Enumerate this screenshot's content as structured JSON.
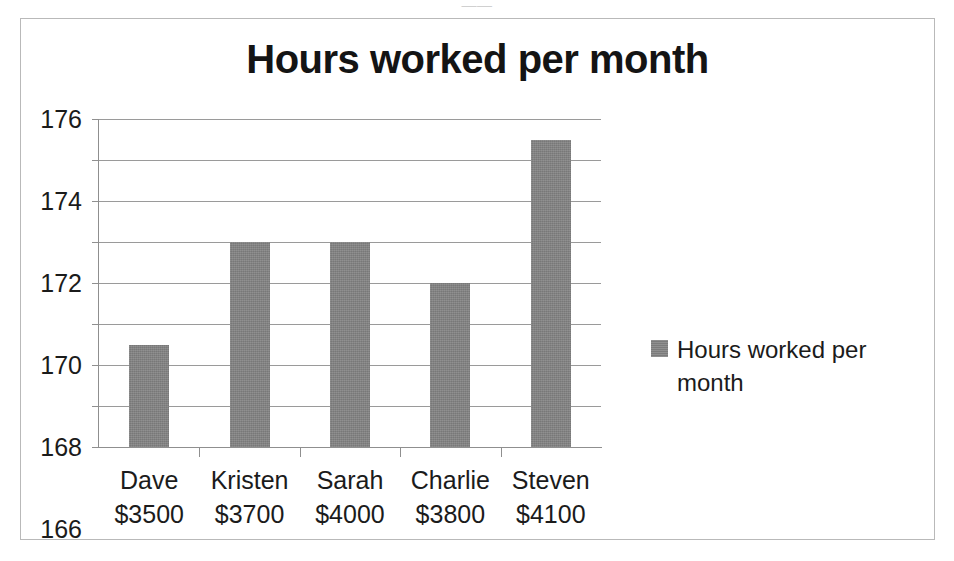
{
  "scan": {
    "top_remnant_text": "——"
  },
  "chart_data": {
    "type": "bar",
    "title": "Hours worked per month",
    "xlabel": "",
    "ylabel": "",
    "ylim": [
      160,
      176
    ],
    "ystep": 2,
    "grid": true,
    "legend_position": "right",
    "bar_color": "#838383",
    "categories": [
      "Dave",
      "Kristen",
      "Sarah",
      "Charlie",
      "Steven"
    ],
    "category_sublabels": [
      "$3500",
      "$3700",
      "$4000",
      "$3800",
      "$4100"
    ],
    "values": [
      165,
      170,
      170,
      168,
      175
    ],
    "ytick_labels": [
      "176",
      "174",
      "172",
      "170",
      "168",
      "166",
      "164",
      "162",
      "160"
    ],
    "series": [
      {
        "name": "Hours worked per month",
        "values": [
          165,
          170,
          170,
          168,
          175
        ]
      }
    ],
    "legend": [
      {
        "label": "Hours worked per month",
        "color": "#838383"
      }
    ]
  }
}
